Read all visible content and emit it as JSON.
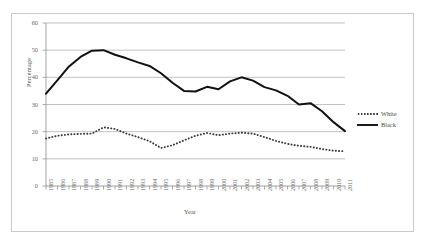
{
  "chart_data": {
    "type": "line",
    "title": "",
    "xlabel": "Year",
    "ylabel": "Percentage",
    "ylim": [
      0,
      60
    ],
    "ytick_values": [
      0,
      10,
      20,
      30,
      40,
      50,
      60
    ],
    "grid": "horizontal",
    "legend_position": "right",
    "categories": [
      "1985",
      "1986",
      "1987",
      "1988",
      "1989",
      "1990",
      "1991",
      "1992",
      "1993",
      "1994",
      "1995",
      "1996",
      "1997",
      "1998",
      "1999",
      "2000",
      "2001",
      "2002",
      "2003",
      "2004",
      "2005",
      "2006",
      "2007",
      "2008",
      "2009",
      "2010",
      "2011"
    ],
    "series": [
      {
        "name": "White",
        "style": "dotted",
        "color": "#3a3a3a",
        "values": [
          17.5,
          18.5,
          19.0,
          19.2,
          19.3,
          21.6,
          21.0,
          19.3,
          18.0,
          16.5,
          14.0,
          15.0,
          16.8,
          18.5,
          19.5,
          18.7,
          19.3,
          19.6,
          19.3,
          18.0,
          16.6,
          15.5,
          14.8,
          14.4,
          13.6,
          13.0,
          12.8
        ]
      },
      {
        "name": "Black",
        "style": "solid",
        "color": "#111111",
        "values": [
          34.0,
          39.0,
          44.0,
          47.5,
          49.8,
          50.0,
          48.3,
          47.0,
          45.5,
          44.2,
          41.5,
          38.0,
          35.0,
          34.8,
          36.5,
          35.6,
          38.5,
          40.0,
          38.8,
          36.4,
          35.2,
          33.2,
          30.0,
          30.5,
          27.5,
          23.5,
          20.2
        ]
      }
    ]
  },
  "legend": {
    "entries": [
      {
        "label": "White",
        "marker": "dotted-line-swatch"
      },
      {
        "label": "Black",
        "marker": "solid-line-swatch"
      }
    ]
  }
}
